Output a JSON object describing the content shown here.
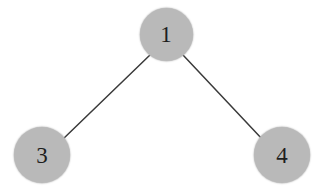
{
  "figure": {
    "type": "node-link-graph",
    "width": 325,
    "height": 194,
    "background_color": "#ffffff"
  },
  "style": {
    "node_fill_color": "#b9b9b9",
    "node_label_color": "#1e1e1e",
    "edge_color": "#3a3a3a",
    "edge_width": 1.5
  },
  "nodes": [
    {
      "id": "1",
      "label": "1",
      "cx": 166,
      "cy": 34,
      "r": 26.5
    },
    {
      "id": "3",
      "label": "3",
      "cx": 42,
      "cy": 155,
      "r": 28
    },
    {
      "id": "4",
      "label": "4",
      "cx": 282,
      "cy": 155,
      "r": 28
    }
  ],
  "edges": [
    {
      "id": "edge-1-3",
      "source": "1",
      "target": "3",
      "x1": 150,
      "y1": 55,
      "x2": 62,
      "y2": 140
    },
    {
      "id": "edge-1-4",
      "source": "1",
      "target": "4",
      "x1": 183,
      "y1": 55,
      "x2": 263,
      "y2": 140
    }
  ]
}
